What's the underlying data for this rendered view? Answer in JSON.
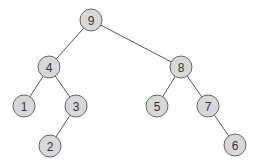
{
  "diagram": {
    "type": "binary-tree",
    "colors": {
      "background": "#ffffff",
      "node_fill": "#d8d8d8",
      "node_stroke": "#666666",
      "edge": "#555555",
      "label": "#333333"
    },
    "node_radius": 11,
    "nodes": [
      {
        "id": "n9",
        "label": "9",
        "x": 91,
        "y": 20
      },
      {
        "id": "n4",
        "label": "4",
        "x": 49,
        "y": 67
      },
      {
        "id": "n8",
        "label": "8",
        "x": 181,
        "y": 67
      },
      {
        "id": "n1",
        "label": "1",
        "x": 24,
        "y": 106
      },
      {
        "id": "n3",
        "label": "3",
        "x": 76,
        "y": 106
      },
      {
        "id": "n5",
        "label": "5",
        "x": 157,
        "y": 106
      },
      {
        "id": "n7",
        "label": "7",
        "x": 208,
        "y": 106
      },
      {
        "id": "n2",
        "label": "2",
        "x": 50,
        "y": 146
      },
      {
        "id": "n6",
        "label": "6",
        "x": 235,
        "y": 145
      }
    ],
    "edges": [
      {
        "from": "n9",
        "to": "n4"
      },
      {
        "from": "n9",
        "to": "n8"
      },
      {
        "from": "n4",
        "to": "n1"
      },
      {
        "from": "n4",
        "to": "n3"
      },
      {
        "from": "n3",
        "to": "n2"
      },
      {
        "from": "n8",
        "to": "n5"
      },
      {
        "from": "n8",
        "to": "n7"
      },
      {
        "from": "n7",
        "to": "n6"
      }
    ]
  }
}
